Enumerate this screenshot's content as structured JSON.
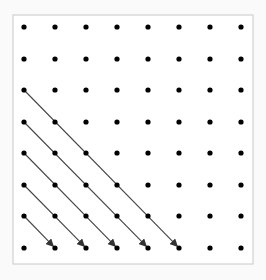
{
  "diagram": {
    "grid": {
      "cols": 8,
      "rows": 8,
      "x": [
        24,
        55,
        86,
        117,
        148,
        179,
        210,
        241
      ],
      "y": [
        27,
        59,
        90,
        122,
        153,
        185,
        216,
        248
      ],
      "dot_radius": 2.6,
      "dot_color": "#000000"
    },
    "frame": {
      "x": 13,
      "y": 15,
      "width": 240,
      "height": 249,
      "stroke": "#c8c8c8"
    },
    "arrows": [
      {
        "from": [
          0,
          2
        ],
        "to": [
          5,
          7
        ]
      },
      {
        "from": [
          0,
          3
        ],
        "to": [
          4,
          7
        ]
      },
      {
        "from": [
          0,
          4
        ],
        "to": [
          3,
          7
        ]
      },
      {
        "from": [
          0,
          5
        ],
        "to": [
          2,
          7
        ]
      },
      {
        "from": [
          0,
          6
        ],
        "to": [
          1,
          7
        ]
      }
    ],
    "arrow_color": "#444444"
  }
}
